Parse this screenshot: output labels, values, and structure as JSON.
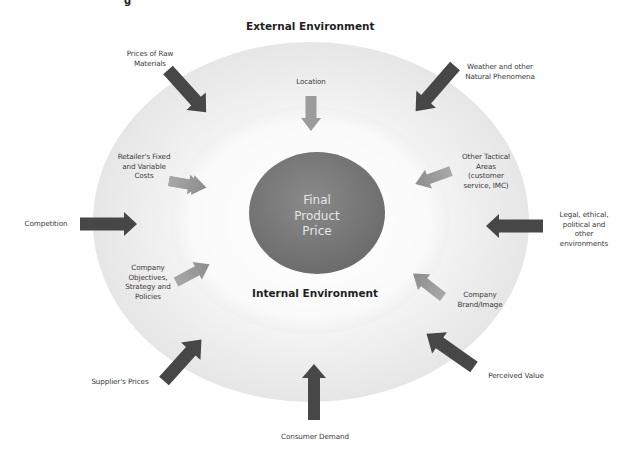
{
  "diagram": {
    "top_clipped_glyph": "g",
    "external_title": "External Environment",
    "internal_title": "Internal Environment",
    "center": {
      "label": "Final\nProduct\nPrice",
      "fill": "#7a7a7a"
    },
    "colors": {
      "outer_ring": "#e9e9e9",
      "inner_area": "#fbfbfb",
      "external_arrow": "#4a4a4a",
      "internal_arrow": "#9a9a9a"
    },
    "external_factors": [
      {
        "id": "raw-materials",
        "label": "Prices of Raw\nMaterials"
      },
      {
        "id": "weather",
        "label": "Weather and other\nNatural Phenomena"
      },
      {
        "id": "competition",
        "label": "Competition"
      },
      {
        "id": "legal",
        "label": "Legal, ethical,\npolitical and\nother\nenvironments"
      },
      {
        "id": "supplier-prices",
        "label": "Supplier's Prices"
      },
      {
        "id": "consumer-demand",
        "label": "Consumer Demand"
      },
      {
        "id": "perceived-value",
        "label": "Perceived Value"
      }
    ],
    "internal_factors": [
      {
        "id": "location",
        "label": "Location"
      },
      {
        "id": "retailer-costs",
        "label": "Retailer's Fixed\nand Variable\nCosts"
      },
      {
        "id": "company-objectives",
        "label": "Company\nObjectives,\nStrategy and\nPolicies"
      },
      {
        "id": "other-tactical",
        "label": "Other Tactical\nAreas\n(customer\nservice, IMC)"
      },
      {
        "id": "brand-image",
        "label": "Company\nBrand/Image"
      }
    ]
  }
}
